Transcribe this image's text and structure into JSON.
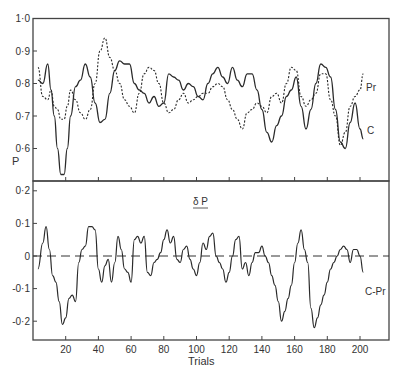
{
  "chart_data": [
    {
      "type": "line",
      "panel": "upper",
      "title": "",
      "xlabel": "",
      "ylabel": "P",
      "ylim": [
        0.5,
        1.0
      ],
      "xlim": [
        0,
        218
      ],
      "yticks": [
        "0·6",
        "0·7",
        "0·8",
        "0·9",
        "1·0"
      ],
      "ytick_values": [
        0.6,
        0.7,
        0.8,
        0.9,
        1.0
      ],
      "grid": false,
      "legend": "inline labels at right end",
      "series": [
        {
          "name": "C",
          "style": "solid",
          "x": [
            3,
            6,
            9,
            11,
            13,
            15,
            17,
            19,
            21,
            23,
            26,
            29,
            32,
            35,
            38,
            41,
            44,
            47,
            50,
            53,
            56,
            59,
            62,
            65,
            68,
            71,
            74,
            77,
            80,
            83,
            86,
            89,
            92,
            95,
            98,
            101,
            104,
            107,
            110,
            113,
            116,
            119,
            122,
            125,
            128,
            131,
            134,
            137,
            140,
            143,
            146,
            149,
            152,
            155,
            158,
            161,
            164,
            167,
            170,
            173,
            176,
            179,
            182,
            185,
            188,
            191,
            194,
            197,
            200,
            202
          ],
          "values": [
            0.81,
            0.8,
            0.86,
            0.78,
            0.7,
            0.6,
            0.52,
            0.52,
            0.6,
            0.7,
            0.79,
            0.81,
            0.86,
            0.82,
            0.74,
            0.68,
            0.69,
            0.77,
            0.84,
            0.87,
            0.86,
            0.86,
            0.8,
            0.78,
            0.77,
            0.74,
            0.76,
            0.73,
            0.74,
            0.83,
            0.82,
            0.81,
            0.78,
            0.8,
            0.79,
            0.76,
            0.75,
            0.8,
            0.83,
            0.85,
            0.82,
            0.8,
            0.85,
            0.81,
            0.79,
            0.83,
            0.83,
            0.78,
            0.72,
            0.65,
            0.62,
            0.67,
            0.7,
            0.76,
            0.78,
            0.82,
            0.73,
            0.66,
            0.72,
            0.8,
            0.86,
            0.85,
            0.82,
            0.72,
            0.62,
            0.6,
            0.68,
            0.74,
            0.66,
            0.63
          ]
        },
        {
          "name": "Pr",
          "style": "dashed",
          "x": [
            3,
            6,
            9,
            11,
            13,
            15,
            17,
            19,
            21,
            23,
            26,
            29,
            32,
            35,
            38,
            41,
            44,
            47,
            50,
            53,
            56,
            59,
            62,
            65,
            68,
            71,
            74,
            77,
            80,
            83,
            86,
            89,
            92,
            95,
            98,
            101,
            104,
            107,
            110,
            113,
            116,
            119,
            122,
            125,
            128,
            131,
            134,
            137,
            140,
            143,
            146,
            149,
            152,
            155,
            158,
            161,
            164,
            167,
            170,
            173,
            176,
            179,
            182,
            185,
            188,
            191,
            194,
            197,
            200,
            202
          ],
          "values": [
            0.85,
            0.76,
            0.75,
            0.78,
            0.73,
            0.72,
            0.69,
            0.69,
            0.73,
            0.78,
            0.75,
            0.71,
            0.69,
            0.72,
            0.8,
            0.9,
            0.94,
            0.88,
            0.84,
            0.8,
            0.75,
            0.73,
            0.71,
            0.77,
            0.83,
            0.85,
            0.84,
            0.8,
            0.74,
            0.71,
            0.72,
            0.75,
            0.77,
            0.74,
            0.75,
            0.76,
            0.77,
            0.77,
            0.79,
            0.8,
            0.79,
            0.75,
            0.72,
            0.69,
            0.66,
            0.71,
            0.72,
            0.74,
            0.73,
            0.71,
            0.76,
            0.77,
            0.74,
            0.8,
            0.85,
            0.84,
            0.76,
            0.73,
            0.75,
            0.77,
            0.83,
            0.83,
            0.75,
            0.7,
            0.61,
            0.65,
            0.73,
            0.76,
            0.78,
            0.83
          ]
        }
      ],
      "annotations": [
        {
          "text": "Pr",
          "near": "right end of dashed series"
        },
        {
          "text": "C",
          "near": "right end of solid series"
        }
      ]
    },
    {
      "type": "line",
      "panel": "lower",
      "title": "δ P",
      "xlabel": "Trials",
      "ylabel": "",
      "ylim": [
        -0.26,
        0.23
      ],
      "xlim": [
        0,
        218
      ],
      "xticks": [
        "20",
        "40",
        "60",
        "80",
        "100",
        "120",
        "140",
        "160",
        "180",
        "200"
      ],
      "xtick_values": [
        20,
        40,
        60,
        80,
        100,
        120,
        140,
        160,
        180,
        200
      ],
      "yticks": [
        "0·2",
        "0·1",
        "0",
        "-0·1",
        "-0·2"
      ],
      "ytick_values": [
        0.2,
        0.1,
        0,
        -0.1,
        -0.2
      ],
      "grid": false,
      "reference_line": {
        "y": 0,
        "style": "dashed"
      },
      "series": [
        {
          "name": "C-Pr",
          "style": "solid",
          "x": [
            3,
            6,
            8,
            10,
            12,
            14,
            16,
            18,
            20,
            22,
            24,
            26,
            28,
            30,
            32,
            34,
            36,
            38,
            40,
            42,
            44,
            46,
            48,
            50,
            52,
            54,
            56,
            58,
            60,
            62,
            64,
            66,
            68,
            70,
            72,
            74,
            76,
            78,
            80,
            82,
            84,
            86,
            88,
            90,
            92,
            94,
            96,
            98,
            100,
            102,
            104,
            106,
            108,
            110,
            112,
            114,
            116,
            118,
            120,
            122,
            124,
            126,
            128,
            130,
            132,
            134,
            136,
            138,
            140,
            142,
            144,
            146,
            148,
            150,
            152,
            154,
            156,
            158,
            160,
            162,
            164,
            166,
            168,
            170,
            172,
            174,
            176,
            178,
            180,
            182,
            184,
            186,
            188,
            190,
            192,
            194,
            196,
            198,
            200,
            202
          ],
          "values": [
            -0.04,
            0.04,
            0.09,
            0.02,
            -0.06,
            -0.08,
            -0.14,
            -0.21,
            -0.19,
            -0.13,
            -0.12,
            -0.14,
            -0.02,
            0.02,
            0.03,
            0.09,
            0.09,
            0.08,
            -0.04,
            -0.08,
            -0.03,
            -0.01,
            -0.08,
            -0.02,
            0.06,
            0.02,
            -0.04,
            -0.05,
            -0.08,
            0.05,
            0.06,
            0.04,
            0.06,
            -0.05,
            -0.06,
            -0.02,
            -0.01,
            0.01,
            0.05,
            0.08,
            0.04,
            0.06,
            -0.01,
            -0.02,
            0.02,
            0.03,
            -0.01,
            -0.04,
            -0.06,
            -0.02,
            0.04,
            0.02,
            0.06,
            0.07,
            0.0,
            -0.02,
            -0.04,
            -0.08,
            -0.05,
            0.0,
            0.05,
            0.06,
            -0.04,
            -0.02,
            -0.06,
            -0.02,
            0.01,
            0.01,
            0.03,
            0.0,
            -0.02,
            -0.06,
            -0.09,
            -0.14,
            -0.2,
            -0.17,
            -0.13,
            -0.09,
            -0.02,
            0.04,
            0.08,
            0.02,
            -0.02,
            -0.16,
            -0.22,
            -0.19,
            -0.15,
            -0.12,
            -0.08,
            -0.04,
            -0.02,
            0.0,
            0.02,
            0.03,
            0.02,
            -0.02,
            0.02,
            0.02,
            0.0,
            -0.05
          ]
        }
      ],
      "annotations": [
        {
          "text": "C-Pr",
          "near": "right end of series"
        }
      ]
    }
  ],
  "figure": {
    "upper_panel": {
      "ylabel": "P",
      "yticks": [
        "0·6",
        "0·7",
        "0·8",
        "0·9",
        "1·0"
      ],
      "label_pr": "Pr",
      "label_c": "C"
    },
    "lower_panel": {
      "title": "δ P",
      "yticks": [
        "0·2",
        "0·1",
        "0",
        "-0·1",
        "-0·2"
      ],
      "label_cpr": "C-Pr"
    },
    "xaxis": {
      "label": "Trials",
      "ticks": [
        "20",
        "40",
        "60",
        "80",
        "100",
        "120",
        "140",
        "160",
        "180",
        "200"
      ]
    }
  }
}
